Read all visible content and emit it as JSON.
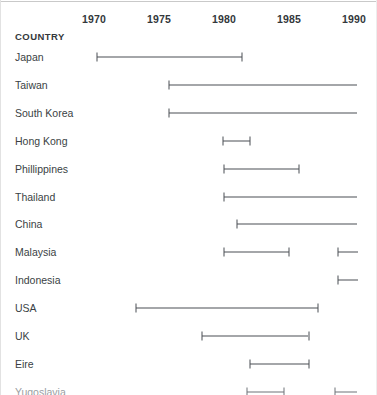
{
  "chart_data": {
    "type": "bar",
    "title": "",
    "xlabel": "",
    "ylabel": "COUNTRY",
    "grid": false,
    "legend": "none",
    "xlim": [
      1968.2,
      1990.3
    ],
    "x_ticks": [
      1970,
      1975,
      1980,
      1985,
      1990
    ],
    "x_tick_labels": [
      "1970",
      "1975",
      "1980",
      "1985",
      "1990"
    ],
    "categories": [
      "Japan",
      "Taiwan",
      "South Korea",
      "Hong Kong",
      "Phillippines",
      "Thailand",
      "China",
      "Malaysia",
      "Indonesia",
      "USA",
      "UK",
      "Eire",
      "Yugoslavia"
    ],
    "rows": [
      {
        "label": "Japan",
        "muted": false,
        "segments": [
          {
            "start": 1970.2,
            "end": 1981.4,
            "start_cap": true,
            "end_cap": true
          }
        ]
      },
      {
        "label": "Taiwan",
        "muted": false,
        "segments": [
          {
            "start": 1975.8,
            "end": 1990.2,
            "start_cap": true,
            "end_cap": false
          }
        ]
      },
      {
        "label": "South Korea",
        "muted": false,
        "segments": [
          {
            "start": 1975.8,
            "end": 1990.2,
            "start_cap": true,
            "end_cap": false
          }
        ]
      },
      {
        "label": "Hong Kong",
        "muted": false,
        "segments": [
          {
            "start": 1979.9,
            "end": 1982.0,
            "start_cap": true,
            "end_cap": true
          }
        ]
      },
      {
        "label": "Phillippines",
        "muted": false,
        "segments": [
          {
            "start": 1980.0,
            "end": 1985.8,
            "start_cap": true,
            "end_cap": true
          }
        ]
      },
      {
        "label": "Thailand",
        "muted": false,
        "segments": [
          {
            "start": 1980.0,
            "end": 1990.2,
            "start_cap": true,
            "end_cap": false
          }
        ]
      },
      {
        "label": "China",
        "muted": false,
        "segments": [
          {
            "start": 1981.0,
            "end": 1990.2,
            "start_cap": true,
            "end_cap": false
          }
        ]
      },
      {
        "label": "Malaysia",
        "muted": false,
        "segments": [
          {
            "start": 1980.0,
            "end": 1985.0,
            "start_cap": true,
            "end_cap": true
          },
          {
            "start": 1988.8,
            "end": 1990.3,
            "start_cap": true,
            "end_cap": false
          }
        ]
      },
      {
        "label": "Indonesia",
        "muted": false,
        "segments": [
          {
            "start": 1988.8,
            "end": 1990.3,
            "start_cap": true,
            "end_cap": false
          }
        ]
      },
      {
        "label": "USA",
        "muted": false,
        "segments": [
          {
            "start": 1973.2,
            "end": 1987.2,
            "start_cap": true,
            "end_cap": true
          }
        ]
      },
      {
        "label": "UK",
        "muted": false,
        "segments": [
          {
            "start": 1978.3,
            "end": 1986.5,
            "start_cap": true,
            "end_cap": true
          }
        ]
      },
      {
        "label": "Eire",
        "muted": false,
        "segments": [
          {
            "start": 1982.0,
            "end": 1986.5,
            "start_cap": true,
            "end_cap": true
          }
        ]
      },
      {
        "label": "Yugoslavia",
        "muted": true,
        "segments": [
          {
            "start": 1981.8,
            "end": 1984.6,
            "start_cap": true,
            "end_cap": true
          },
          {
            "start": 1988.5,
            "end": 1990.2,
            "start_cap": true,
            "end_cap": false
          }
        ]
      }
    ]
  },
  "header": {
    "country_label": "COUNTRY"
  },
  "colors": {
    "line": "#4a4f54",
    "label": "#3a3f44",
    "muted_label": "#9a9ea2",
    "background": "#ffffff",
    "rule": "#c9c9c9"
  }
}
